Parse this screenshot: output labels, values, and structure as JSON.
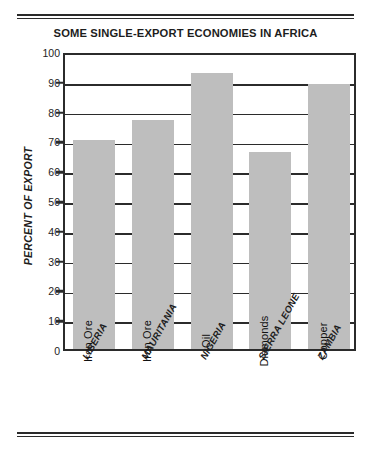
{
  "chart_data": {
    "type": "bar",
    "title": "SOME SINGLE-EXPORT ECONOMIES IN AFRICA",
    "xlabel": "",
    "ylabel": "PERCENT OF EXPORT",
    "ylim": [
      0,
      100
    ],
    "ytick_step": 10,
    "yticks": [
      "100",
      "90",
      "80",
      "70",
      "60",
      "50",
      "40",
      "30",
      "20",
      "10",
      "0"
    ],
    "grid": true,
    "legend": "none",
    "bar_color": "#bebebe",
    "categories": [
      "LIBERIA",
      "MAURITANIA",
      "NIGERIA",
      "SIERRA LEONE",
      "ZAMBIA"
    ],
    "values": [
      70,
      77,
      92.5,
      66,
      89
    ],
    "point_labels": [
      "Iron Ore",
      "Iron Ore",
      "Oil",
      "Diamonds",
      "Copper"
    ],
    "bars": [
      {
        "category": "LIBERIA",
        "value": 70,
        "commodity": "Iron Ore"
      },
      {
        "category": "MAURITANIA",
        "value": 77,
        "commodity": "Iron Ore"
      },
      {
        "category": "NIGERIA",
        "value": 92.5,
        "commodity": "Oil"
      },
      {
        "category": "SIERRA LEONE",
        "value": 66,
        "commodity": "Diamonds"
      },
      {
        "category": "ZAMBIA",
        "value": 89,
        "commodity": "Copper"
      }
    ]
  },
  "decoration": {
    "top_rule": "double-rule",
    "bottom_rule": "double-rule"
  }
}
